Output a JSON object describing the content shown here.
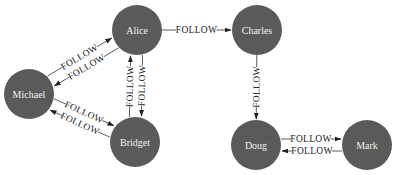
{
  "graph": {
    "node_color": "#5a5a5a",
    "node_text_color": "#f0f0f0",
    "edge_color": "#333333",
    "node_radius": 25,
    "nodes": [
      {
        "id": "alice",
        "label": "Alice",
        "x": 137,
        "y": 30
      },
      {
        "id": "charles",
        "label": "Charles",
        "x": 257,
        "y": 30
      },
      {
        "id": "michael",
        "label": "Michael",
        "x": 29,
        "y": 94
      },
      {
        "id": "bridget",
        "label": "Bridget",
        "x": 135,
        "y": 142
      },
      {
        "id": "doug",
        "label": "Doug",
        "x": 256,
        "y": 145
      },
      {
        "id": "mark",
        "label": "Mark",
        "x": 367,
        "y": 145
      }
    ],
    "edges": [
      {
        "id": "alice-charles",
        "from": "alice",
        "to": "charles",
        "label": "FOLLOW",
        "offset": 0
      },
      {
        "id": "michael-alice",
        "from": "michael",
        "to": "alice",
        "label": "FOLLOW",
        "offset": -6
      },
      {
        "id": "alice-michael",
        "from": "alice",
        "to": "michael",
        "label": "FOLLOW",
        "offset": -6
      },
      {
        "id": "alice-bridget",
        "from": "alice",
        "to": "bridget",
        "label": "FOLLOW",
        "offset": -6
      },
      {
        "id": "bridget-alice",
        "from": "bridget",
        "to": "alice",
        "label": "FOLLOW",
        "offset": -6
      },
      {
        "id": "michael-bridget",
        "from": "michael",
        "to": "bridget",
        "label": "FOLLOW",
        "offset": -6
      },
      {
        "id": "bridget-michael",
        "from": "bridget",
        "to": "michael",
        "label": "FOLLOW",
        "offset": -6
      },
      {
        "id": "charles-doug",
        "from": "charles",
        "to": "doug",
        "label": "FOLLOW",
        "offset": 0
      },
      {
        "id": "doug-mark",
        "from": "doug",
        "to": "mark",
        "label": "FOLLOW",
        "offset": -6
      },
      {
        "id": "mark-doug",
        "from": "mark",
        "to": "doug",
        "label": "FOLLOW",
        "offset": -6
      }
    ]
  }
}
